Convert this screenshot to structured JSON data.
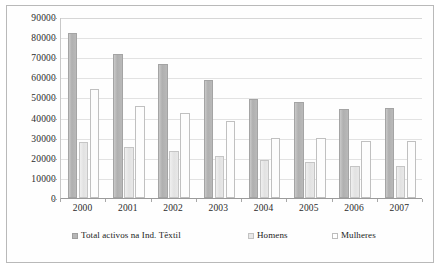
{
  "chart_data": {
    "type": "bar",
    "title": "",
    "xlabel": "",
    "ylabel": "",
    "categories": [
      "2000",
      "2001",
      "2002",
      "2003",
      "2004",
      "2005",
      "2006",
      "2007"
    ],
    "series": [
      {
        "name": "Total activos na Ind. Têxtil",
        "values": [
          82000,
          71500,
          66500,
          58500,
          49000,
          47500,
          44500,
          45000
        ]
      },
      {
        "name": "Homens",
        "values": [
          28000,
          25500,
          23500,
          21000,
          19000,
          18000,
          16000,
          16000
        ]
      },
      {
        "name": "Mulheres",
        "values": [
          54000,
          46000,
          42500,
          38500,
          30000,
          30000,
          28500,
          28500
        ]
      }
    ],
    "ylim": [
      0,
      90000
    ],
    "ytick_values": [
      0,
      10000,
      20000,
      30000,
      40000,
      50000,
      60000,
      70000,
      80000,
      90000
    ],
    "ytick_labels": [
      "0",
      "10000",
      "20000",
      "30000",
      "40000",
      "50000",
      "60000",
      "70000",
      "80000",
      "90000"
    ],
    "grid": true,
    "legend_position": "bottom",
    "colors": {
      "series_0": "#b6b6b6",
      "series_1": "#e8e8e8",
      "series_2": "#ffffff",
      "gridline": "#e2e2e2",
      "axis": "#9a9a9a",
      "text": "#2b2b2b",
      "frame": "#b9b9b9",
      "background": "#ffffff"
    }
  },
  "legend": {
    "items": [
      {
        "label": "Total activos na Ind. Têxtil",
        "swatch": "series-0-swatch"
      },
      {
        "label": "Homens",
        "swatch": "series-1-swatch"
      },
      {
        "label": "Mulheres",
        "swatch": "series-2-swatch"
      }
    ]
  }
}
